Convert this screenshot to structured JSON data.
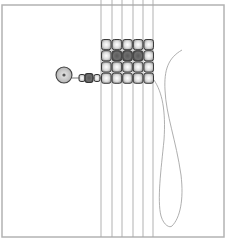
{
  "diagram": {
    "kind": "bead-loom-weaving-illustration",
    "frame": {
      "x": 2,
      "y": 5,
      "width": 222,
      "height": 232,
      "stroke": "#b3b3b3"
    },
    "warp_threads": {
      "x": [
        101,
        112,
        122,
        133,
        143,
        153
      ],
      "y_top": 0,
      "y_bottom": 237,
      "stroke": "#a8a8a8"
    },
    "bead_grid": {
      "x": 101,
      "y": 39,
      "cols": 5,
      "rows": 4,
      "cell_w": 10.6,
      "cell_h": 11.2,
      "light_color": "#d9d9d9",
      "dark_color": "#7a7a7a",
      "outline": "#3c3c3c",
      "dark_cells": [
        [
          1,
          1
        ],
        [
          1,
          2
        ],
        [
          1,
          3
        ]
      ]
    },
    "stop_bead": {
      "cx": 64,
      "cy": 75,
      "r": 8
    },
    "tail_beads": [
      {
        "cx": 82,
        "cy": 78,
        "w": 6,
        "h": 7,
        "tone": "light"
      },
      {
        "cx": 89,
        "cy": 78,
        "w": 8,
        "h": 9,
        "tone": "dark"
      },
      {
        "cx": 97,
        "cy": 78,
        "w": 6,
        "h": 7,
        "tone": "light"
      }
    ],
    "weft_thread": {
      "stroke": "#9a9a9a"
    }
  }
}
